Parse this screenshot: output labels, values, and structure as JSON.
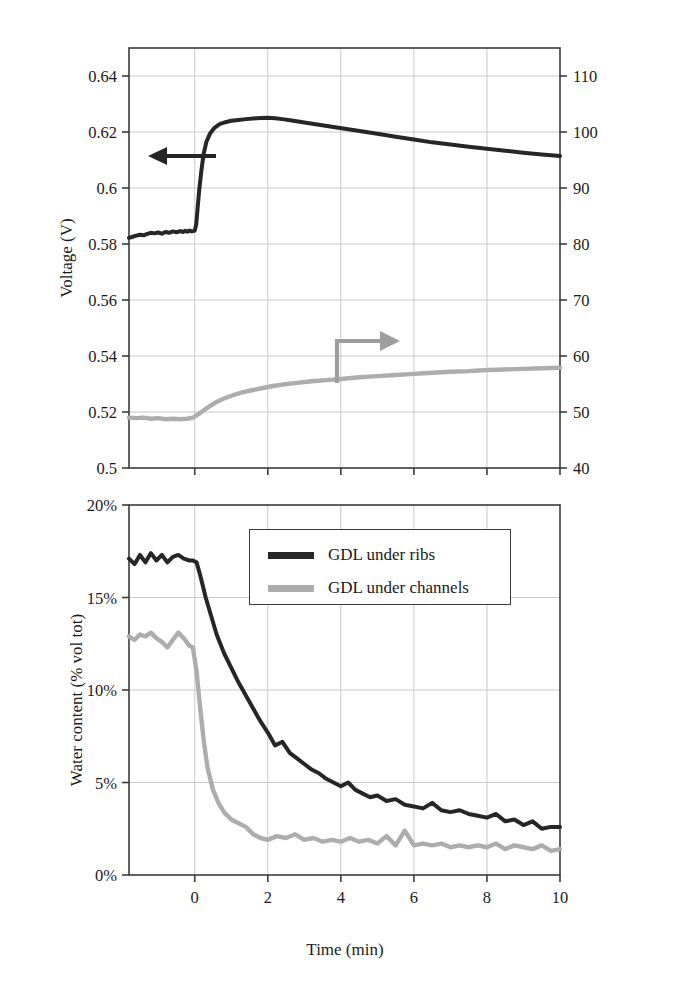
{
  "figure": {
    "background": "#ffffff",
    "series_colors": {
      "dark": "#262626",
      "light": "#adadad"
    },
    "axis_color": "#3b3b3b",
    "grid_color": "#c9c9c9"
  },
  "legend": {
    "items": [
      {
        "label": "GDL under ribs",
        "color": "#262626"
      },
      {
        "label": "GDL under channels",
        "color": "#adadad"
      }
    ]
  },
  "annotations": {
    "top_left_arrow": {
      "name": "left-arrow-voltage",
      "direction": "left",
      "color": "#262626"
    },
    "top_right_arrow": {
      "name": "right-arrow-resistance",
      "direction": "right",
      "color": "#9e9e9e"
    }
  },
  "chart_data": [
    {
      "id": "top",
      "type": "line",
      "title": "",
      "xlabel": "",
      "ylabel": "Voltage (V)",
      "y2label": "HF specific resistance (mΩ·cm⁻²)",
      "grid": true,
      "legend_position": "none",
      "xlim": [
        -1.8,
        10
      ],
      "ylim": [
        0.5,
        0.65
      ],
      "y2lim": [
        40,
        115
      ],
      "xticks": [
        0,
        2,
        4,
        6,
        8,
        10
      ],
      "xticklabels": [
        "0",
        "2",
        "4",
        "6",
        "8",
        "10"
      ],
      "yticks": [
        0.5,
        0.52,
        0.54,
        0.56,
        0.58,
        0.6,
        0.62,
        0.64
      ],
      "yticklabels": [
        "0.5",
        "0.52",
        "0.54",
        "0.56",
        "0.58",
        "0.6",
        "0.62",
        "0.64"
      ],
      "y2ticks": [
        40,
        50,
        60,
        70,
        80,
        90,
        100,
        110
      ],
      "y2ticklabels": [
        "40",
        "50",
        "60",
        "70",
        "80",
        "90",
        "100",
        "110"
      ],
      "series": [
        {
          "name": "Voltage",
          "axis": "left",
          "color": "#262626",
          "x": [
            -1.8,
            -1.7,
            -1.6,
            -1.5,
            -1.4,
            -1.3,
            -1.2,
            -1.1,
            -1.0,
            -0.9,
            -0.8,
            -0.7,
            -0.6,
            -0.5,
            -0.4,
            -0.32,
            -0.26,
            -0.2,
            -0.14,
            -0.08,
            -0.04,
            0.0,
            0.04,
            0.08,
            0.12,
            0.18,
            0.24,
            0.32,
            0.42,
            0.54,
            0.68,
            0.84,
            1.0,
            1.2,
            1.4,
            1.6,
            1.8,
            2.0,
            2.2,
            2.4,
            2.7,
            3.0,
            3.4,
            3.8,
            4.2,
            4.6,
            5.0,
            5.5,
            6.0,
            6.5,
            7.0,
            7.5,
            8.0,
            8.5,
            9.0,
            9.5,
            10.0
          ],
          "y": [
            0.5822,
            0.5826,
            0.583,
            0.5833,
            0.5831,
            0.5836,
            0.584,
            0.5838,
            0.5841,
            0.5837,
            0.5843,
            0.584,
            0.5845,
            0.5842,
            0.5846,
            0.5843,
            0.5847,
            0.5844,
            0.5848,
            0.5845,
            0.5846,
            0.5848,
            0.587,
            0.593,
            0.599,
            0.606,
            0.612,
            0.6165,
            0.6195,
            0.6215,
            0.6228,
            0.6235,
            0.624,
            0.6243,
            0.6246,
            0.6248,
            0.625,
            0.6251,
            0.6249,
            0.6246,
            0.624,
            0.6234,
            0.6226,
            0.6218,
            0.621,
            0.6202,
            0.6194,
            0.6183,
            0.6173,
            0.6163,
            0.6155,
            0.6147,
            0.614,
            0.6133,
            0.6126,
            0.612,
            0.6114
          ]
        },
        {
          "name": "HF specific resistance",
          "axis": "right",
          "color": "#adadad",
          "x": [
            -1.8,
            -1.6,
            -1.4,
            -1.2,
            -1.0,
            -0.8,
            -0.6,
            -0.4,
            -0.2,
            -0.05,
            0.1,
            0.25,
            0.4,
            0.6,
            0.8,
            1.0,
            1.25,
            1.5,
            1.8,
            2.1,
            2.4,
            2.8,
            3.2,
            3.6,
            4.0,
            4.5,
            5.0,
            5.5,
            6.0,
            6.5,
            7.0,
            7.5,
            8.0,
            8.5,
            9.0,
            9.5,
            10.0
          ],
          "y": [
            49.0,
            48.9,
            49.0,
            48.8,
            48.9,
            48.7,
            48.8,
            48.7,
            48.8,
            49.0,
            49.6,
            50.3,
            51.0,
            51.8,
            52.4,
            52.9,
            53.4,
            53.8,
            54.2,
            54.6,
            54.9,
            55.2,
            55.5,
            55.7,
            55.9,
            56.2,
            56.4,
            56.6,
            56.8,
            57.0,
            57.2,
            57.3,
            57.5,
            57.6,
            57.7,
            57.8,
            57.9
          ]
        }
      ]
    },
    {
      "id": "bottom",
      "type": "line",
      "title": "",
      "xlabel": "Time (min)",
      "ylabel": "Water content (% vol tot)",
      "grid": true,
      "legend_position": "upper-center",
      "xlim": [
        -1.8,
        10
      ],
      "ylim": [
        0,
        20
      ],
      "xticks": [
        0,
        2,
        4,
        6,
        8,
        10
      ],
      "xticklabels": [
        "0",
        "2",
        "4",
        "6",
        "8",
        "10"
      ],
      "yticks": [
        0,
        5,
        10,
        15,
        20
      ],
      "yticklabels": [
        "0%",
        "5%",
        "10%",
        "15%",
        "20%"
      ],
      "series": [
        {
          "name": "GDL under ribs",
          "color": "#262626",
          "x": [
            -1.8,
            -1.65,
            -1.5,
            -1.35,
            -1.2,
            -1.05,
            -0.9,
            -0.75,
            -0.6,
            -0.45,
            -0.3,
            -0.15,
            -0.05,
            0.05,
            0.15,
            0.3,
            0.45,
            0.6,
            0.8,
            1.0,
            1.2,
            1.4,
            1.6,
            1.8,
            2.0,
            2.2,
            2.4,
            2.6,
            2.8,
            3.0,
            3.2,
            3.4,
            3.6,
            3.8,
            4.0,
            4.2,
            4.4,
            4.6,
            4.8,
            5.0,
            5.25,
            5.5,
            5.75,
            6.0,
            6.25,
            6.5,
            6.75,
            7.0,
            7.25,
            7.5,
            7.75,
            8.0,
            8.25,
            8.5,
            8.75,
            9.0,
            9.25,
            9.5,
            9.75,
            10.0
          ],
          "y": [
            17.1,
            16.8,
            17.3,
            16.9,
            17.4,
            17.0,
            17.3,
            16.9,
            17.2,
            17.3,
            17.1,
            17.0,
            17.0,
            16.9,
            16.2,
            15.0,
            14.0,
            13.0,
            12.0,
            11.2,
            10.4,
            9.7,
            9.0,
            8.3,
            7.7,
            7.0,
            7.2,
            6.6,
            6.3,
            6.0,
            5.7,
            5.5,
            5.2,
            5.0,
            4.8,
            5.0,
            4.6,
            4.4,
            4.2,
            4.3,
            4.0,
            4.1,
            3.8,
            3.7,
            3.6,
            3.9,
            3.5,
            3.4,
            3.5,
            3.3,
            3.2,
            3.1,
            3.3,
            2.9,
            3.0,
            2.7,
            2.9,
            2.5,
            2.6,
            2.6
          ]
        },
        {
          "name": "GDL under channels",
          "color": "#adadad",
          "x": [
            -1.8,
            -1.65,
            -1.5,
            -1.35,
            -1.2,
            -1.05,
            -0.9,
            -0.75,
            -0.6,
            -0.45,
            -0.3,
            -0.15,
            -0.05,
            0.05,
            0.15,
            0.25,
            0.35,
            0.5,
            0.65,
            0.8,
            1.0,
            1.2,
            1.4,
            1.6,
            1.8,
            2.0,
            2.25,
            2.5,
            2.75,
            3.0,
            3.25,
            3.5,
            3.75,
            4.0,
            4.25,
            4.5,
            4.75,
            5.0,
            5.25,
            5.5,
            5.75,
            6.0,
            6.25,
            6.5,
            6.75,
            7.0,
            7.25,
            7.5,
            7.75,
            8.0,
            8.25,
            8.5,
            8.75,
            9.0,
            9.25,
            9.5,
            9.75,
            10.0
          ],
          "y": [
            12.9,
            12.7,
            13.0,
            12.9,
            13.1,
            12.8,
            12.6,
            12.3,
            12.7,
            13.1,
            12.8,
            12.4,
            12.3,
            11.0,
            9.0,
            7.2,
            5.8,
            4.6,
            3.9,
            3.4,
            3.0,
            2.8,
            2.6,
            2.2,
            2.0,
            1.9,
            2.1,
            2.0,
            2.2,
            1.9,
            2.0,
            1.8,
            1.9,
            1.8,
            2.0,
            1.8,
            1.9,
            1.7,
            2.1,
            1.6,
            2.4,
            1.6,
            1.7,
            1.6,
            1.7,
            1.5,
            1.6,
            1.5,
            1.6,
            1.5,
            1.7,
            1.4,
            1.6,
            1.5,
            1.4,
            1.6,
            1.3,
            1.4
          ]
        }
      ]
    }
  ]
}
